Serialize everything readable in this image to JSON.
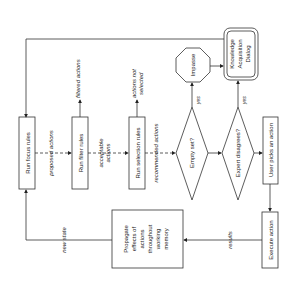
{
  "diagram": {
    "orientation": "rotated 90deg counter-clockwise",
    "nodes": {
      "focus": "Run focus rules",
      "filter": "Run filter rules",
      "selection": "Run selection rules",
      "empty": "Empty set?",
      "expert": "Expert disagrees?",
      "user": "User picks an action",
      "impasse": "Impasse",
      "kad_1": "Knowledge",
      "kad_2": "Acquisition",
      "kad_3": "Dialog",
      "execute": "Execute action",
      "prop_1": "Propagate",
      "prop_2": "effects of",
      "prop_3": "actions",
      "prop_4": "throughout",
      "prop_5": "working",
      "prop_6": "memory"
    },
    "edges": {
      "proposed": "proposed actions",
      "filtered": "filtered actions",
      "acceptable_1": "acceptable",
      "acceptable_2": "actions",
      "not_selected_1": "actions not",
      "not_selected_2": "selected",
      "recommended": "recommended actions",
      "yes1": "yes",
      "yes2": "yes",
      "results": "results",
      "new_state": "new state"
    }
  }
}
